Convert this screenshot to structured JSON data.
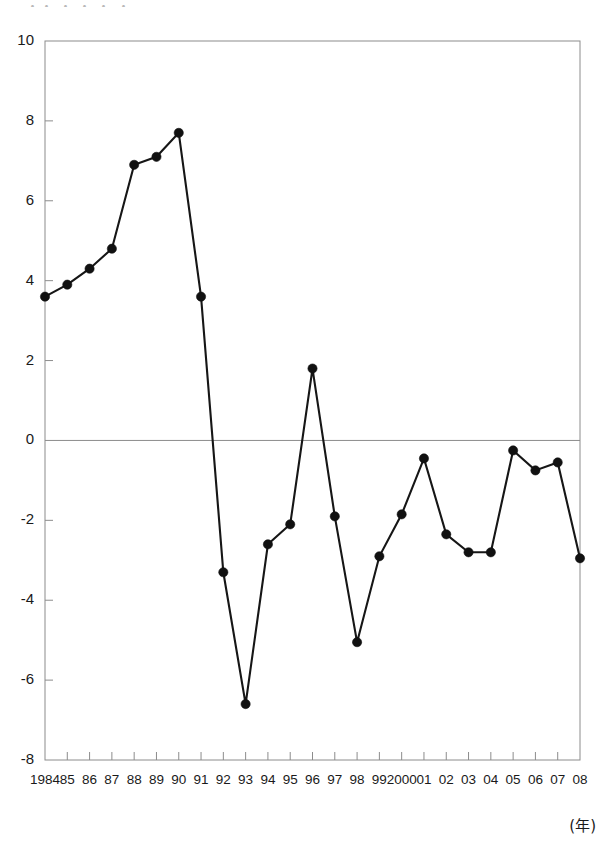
{
  "chart_data": {
    "type": "line",
    "title": "",
    "subtitle": "",
    "xlabel": "(年)",
    "ylabel": "",
    "xlim": [
      1984,
      2008
    ],
    "ylim": [
      -8,
      10
    ],
    "grid": false,
    "legend": null,
    "y_ticks": [
      10,
      8,
      6,
      4,
      2,
      0,
      -2,
      -4,
      -6,
      -8
    ],
    "y_tick_labels": [
      "10",
      "8",
      "6",
      "4",
      "2",
      "0",
      "-2",
      "-4",
      "-6",
      "-8"
    ],
    "x": [
      1984,
      1985,
      1986,
      1987,
      1988,
      1989,
      1990,
      1991,
      1992,
      1993,
      1994,
      1995,
      1996,
      1997,
      1998,
      1999,
      2000,
      2001,
      2002,
      2003,
      2004,
      2005,
      2006,
      2007,
      2008
    ],
    "x_tick_labels": [
      "1984",
      "85",
      "86",
      "87",
      "88",
      "89",
      "90",
      "91",
      "92",
      "93",
      "94",
      "95",
      "96",
      "97",
      "98",
      "99",
      "2000",
      "01",
      "02",
      "03",
      "04",
      "05",
      "06",
      "07",
      "08"
    ],
    "categories": [
      "1984",
      "85",
      "86",
      "87",
      "88",
      "89",
      "90",
      "91",
      "92",
      "93",
      "94",
      "95",
      "96",
      "97",
      "98",
      "99",
      "2000",
      "01",
      "02",
      "03",
      "04",
      "05",
      "06",
      "07",
      "08"
    ],
    "values": [
      3.6,
      3.9,
      4.3,
      4.8,
      6.9,
      7.1,
      7.7,
      3.6,
      -3.3,
      -6.6,
      -2.6,
      -2.1,
      1.8,
      -1.9,
      -5.05,
      -2.9,
      -1.85,
      -0.45,
      -2.35,
      -2.8,
      -2.8,
      -0.25,
      -0.75,
      -0.55,
      -2.95
    ],
    "series": [
      {
        "name": "series-1",
        "values": [
          3.6,
          3.9,
          4.3,
          4.8,
          6.9,
          7.1,
          7.7,
          3.6,
          -3.3,
          -6.6,
          -2.6,
          -2.1,
          1.8,
          -1.9,
          -5.05,
          -2.9,
          -1.85,
          -0.45,
          -2.35,
          -2.8,
          -2.8,
          -0.25,
          -0.75,
          -0.55,
          -2.95
        ],
        "color": "#161616",
        "marker": "circle"
      }
    ],
    "annotations": [],
    "zero_line": 0,
    "line_color": "#161616",
    "marker_color": "#111111",
    "axis_color": "#8c8c8c"
  },
  "axis_caption": "(年)",
  "top_fragment": "・・ ・ ・ ・ ・"
}
